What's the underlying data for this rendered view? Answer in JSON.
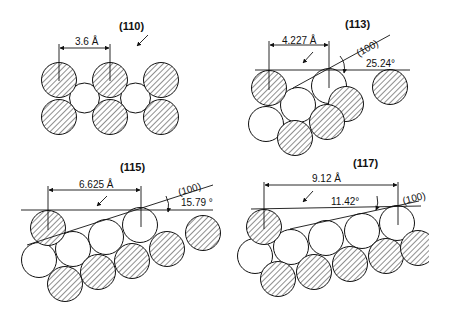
{
  "figure": {
    "panels": [
      {
        "id": "110",
        "title": "(110)",
        "spacing_label": "3.6 Å"
      },
      {
        "id": "113",
        "title": "(113)",
        "spacing_label": "4.227 Å",
        "plane_label": "(100)",
        "angle_label": "25.24°"
      },
      {
        "id": "115",
        "title": "(115)",
        "spacing_label": "6.625 Å",
        "plane_label": "(100)",
        "angle_label": "15.79 °"
      },
      {
        "id": "117",
        "title": "(117)",
        "spacing_label": "9.12 Å",
        "plane_label": "(100)",
        "angle_label": "11.42°"
      }
    ],
    "colors": {
      "stroke": "#111111",
      "background": "#ffffff",
      "hatch": "#333333"
    }
  }
}
